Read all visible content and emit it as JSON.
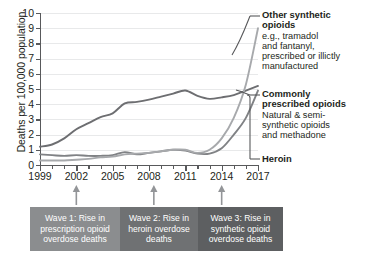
{
  "chart_data": {
    "type": "line",
    "title": "",
    "xlabel": "",
    "ylabel": "Deaths per 100,000 population",
    "xlim": [
      1999,
      2017
    ],
    "ylim": [
      0,
      10
    ],
    "grid": true,
    "legend_position": "right-annotations",
    "x": [
      1999,
      2000,
      2001,
      2002,
      2003,
      2004,
      2005,
      2006,
      2007,
      2008,
      2009,
      2010,
      2011,
      2012,
      2013,
      2014,
      2015,
      2016,
      2017
    ],
    "yticks": [
      0,
      1,
      2,
      3,
      4,
      5,
      6,
      7,
      8,
      9,
      10
    ],
    "xticks_labeled": [
      1999,
      2002,
      2005,
      2008,
      2011,
      2014,
      2017
    ],
    "series": [
      {
        "name": "Commonly prescribed opioids",
        "color": "#6d6e71",
        "values": [
          1.2,
          1.35,
          1.75,
          2.35,
          2.75,
          3.15,
          3.4,
          4.05,
          4.15,
          4.3,
          4.5,
          4.7,
          4.9,
          4.55,
          4.35,
          4.45,
          4.6,
          4.9,
          5.2
        ]
      },
      {
        "name": "Heroin",
        "color": "#808285",
        "values": [
          0.7,
          0.65,
          0.6,
          0.65,
          0.6,
          0.6,
          0.65,
          0.85,
          0.7,
          0.8,
          0.9,
          1.0,
          0.95,
          0.75,
          0.75,
          1.1,
          2.0,
          3.1,
          4.9
        ]
      },
      {
        "name": "Other synthetic opioids",
        "color": "#a7a9ac",
        "values": [
          0.3,
          0.3,
          0.3,
          0.35,
          0.4,
          0.5,
          0.55,
          0.7,
          0.75,
          0.8,
          0.9,
          1.0,
          1.0,
          0.8,
          1.0,
          1.75,
          3.1,
          5.3,
          9.0
        ]
      }
    ]
  },
  "annotations": [
    {
      "id": "other-synthetic-opioids",
      "heading": "Other synthetic",
      "heading2": "opioids",
      "sub_lines": [
        "e.g., tramadol",
        "and fantanyl,",
        "prescribed or illictly",
        "manufactured"
      ]
    },
    {
      "id": "commonly-prescribed-opioids",
      "heading": "Commonly",
      "heading2": "prescribed opioids",
      "sub_lines": [
        "Natural & semi-",
        "synthetic opioids",
        "and methadone"
      ]
    },
    {
      "id": "heroin",
      "heading": "Heroin",
      "heading2": "",
      "sub_lines": []
    }
  ],
  "waves": [
    {
      "id": "wave-1",
      "lines": [
        "Wave 1: Rise in",
        "prescription opioid",
        "overdose deaths"
      ],
      "color": "#8b8d8f",
      "width": 90
    },
    {
      "id": "wave-2",
      "lines": [
        "Wave 2: Rise in",
        "heroin overdose",
        "deaths"
      ],
      "color": "#6f7173",
      "width": 78
    },
    {
      "id": "wave-3",
      "lines": [
        "Wave 3: Rise in",
        "synthetic opioid",
        "overdose deaths"
      ],
      "color": "#5d5f61",
      "width": 85
    }
  ]
}
